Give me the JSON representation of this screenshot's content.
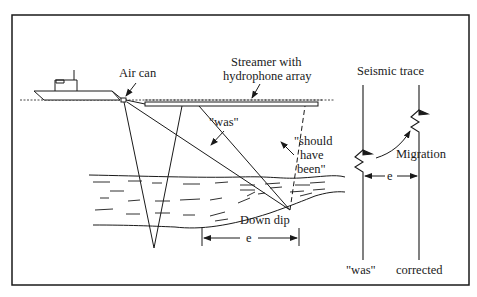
{
  "diagram": {
    "type": "seismic-migration-illustration",
    "labels": {
      "air_can": "Air can",
      "streamer_line1": "Streamer with",
      "streamer_line2": "hydrophone array",
      "was_ray": "\"was\"",
      "should_line1": "\"should",
      "should_line2": "have",
      "should_line3": "been\"",
      "down_dip": "Down dip",
      "offset_e": "e"
    },
    "trace_panel": {
      "title": "Seismic trace",
      "migration_label": "Migration",
      "offset_e": "e",
      "left_trace_label": "\"was\"",
      "right_trace_label": "corrected"
    },
    "colors": {
      "stroke": "#1a1a1a",
      "background": "#ffffff"
    }
  }
}
